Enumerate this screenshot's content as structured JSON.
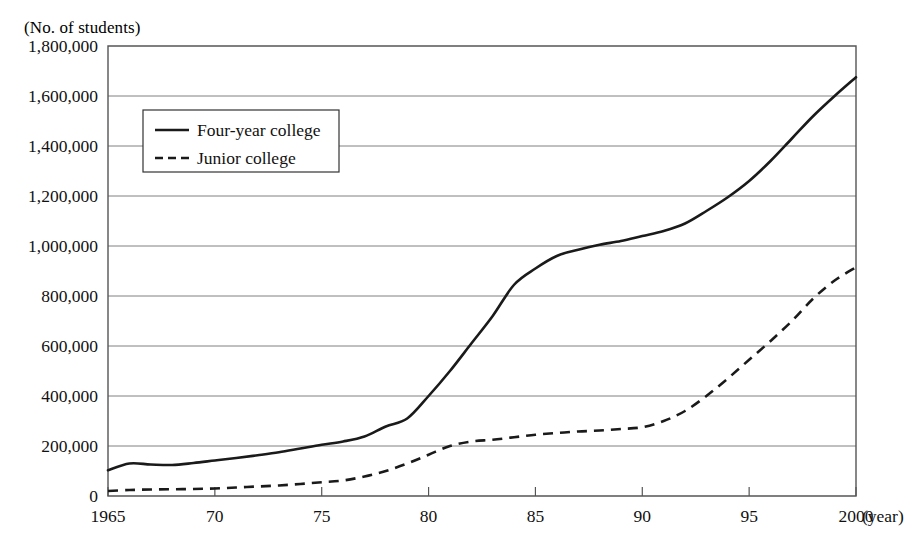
{
  "figure": {
    "unit_label": "(No. of students)",
    "top_partial_text": "",
    "x_axis_unit": "(year)"
  },
  "chart_data": {
    "type": "line",
    "title": "",
    "subtitle": "",
    "xlabel": "(year)",
    "ylabel": "(No. of students)",
    "xlim": [
      1965,
      2000
    ],
    "ylim": [
      0,
      1800000
    ],
    "grid": true,
    "legend_position": "upper-left-inside",
    "y_ticks": [
      0,
      200000,
      400000,
      600000,
      800000,
      1000000,
      1200000,
      1400000,
      1600000,
      1800000
    ],
    "y_tick_labels": [
      "0",
      "200,000",
      "400,000",
      "600,000",
      "800,000",
      "1,000,000",
      "1,200,000",
      "1,400,000",
      "1,600,000",
      "1,800,000"
    ],
    "x_ticks": [
      1965,
      1970,
      1975,
      1980,
      1985,
      1990,
      1995,
      2000
    ],
    "x_tick_labels": [
      "1965",
      "70",
      "75",
      "80",
      "85",
      "90",
      "95",
      "2000"
    ],
    "x": [
      1965,
      1966,
      1967,
      1968,
      1969,
      1970,
      1971,
      1972,
      1973,
      1974,
      1975,
      1976,
      1977,
      1978,
      1979,
      1980,
      1981,
      1982,
      1983,
      1984,
      1985,
      1986,
      1987,
      1988,
      1989,
      1990,
      1991,
      1992,
      1993,
      1994,
      1995,
      1996,
      1997,
      1998,
      1999,
      2000
    ],
    "series": [
      {
        "name": "Four-year college",
        "style": "solid",
        "color": "#1a1a1a",
        "values": [
          103000,
          130000,
          126000,
          124000,
          132000,
          142000,
          152000,
          163000,
          175000,
          190000,
          205000,
          218000,
          238000,
          278000,
          310000,
          400000,
          500000,
          610000,
          720000,
          845000,
          910000,
          960000,
          985000,
          1005000,
          1020000,
          1040000,
          1060000,
          1090000,
          1140000,
          1195000,
          1260000,
          1340000,
          1430000,
          1520000,
          1600000,
          1675000
        ]
      },
      {
        "name": "Junior college",
        "style": "dashed",
        "color": "#1a1a1a",
        "values": [
          20000,
          24000,
          26000,
          27000,
          28000,
          30000,
          34000,
          38000,
          42000,
          48000,
          55000,
          62000,
          78000,
          100000,
          130000,
          165000,
          200000,
          218000,
          225000,
          235000,
          245000,
          252000,
          258000,
          262000,
          268000,
          275000,
          300000,
          340000,
          400000,
          470000,
          545000,
          620000,
          700000,
          790000,
          862000,
          915000
        ]
      }
    ]
  },
  "legend": {
    "items": [
      {
        "label": "Four-year college",
        "style": "solid"
      },
      {
        "label": "Junior college",
        "style": "dashed"
      }
    ]
  }
}
